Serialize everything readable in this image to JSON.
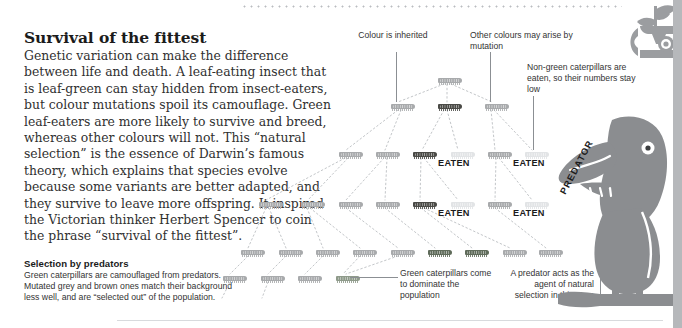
{
  "article": {
    "headline": "Survival of the fittest",
    "body": "Genetic variation can make the difference between life and death. A leaf-eating insect that is leaf-green can stay hidden from insect-eaters, but colour mutations spoil its camouflage. Green leaf-eaters are more likely to survive and breed, whereas other colours will not. This “natural selection” is the essence of Darwin’s famous theory, which explains that species evolve because some variants are better adapted, and they survive to leave more offspring. It inspired the Victorian thinker Herbert Spencer to coin the phrase “survival of the fittest”.",
    "sub_heading": "Selection by predators",
    "sub_body": "Green caterpillars are camouflaged from predators. Mutated grey and brown ones match their background less well, and are “selected out” of the population."
  },
  "annotations": {
    "colour_inherited": "Colour is inherited",
    "other_colours": "Other colours may arise by mutation",
    "non_green": "Non-green caterpillars are eaten, so their numbers stay low",
    "green_dominate": "Green caterpillars come to dominate the population",
    "predator_agent": "A predator acts as the agent of natural selection in this case",
    "eaten_1": "EATEN",
    "eaten_2": "EATEN",
    "eaten_3": "EATEN",
    "eaten_4": "EATEN",
    "predator_label": "PREDATOR"
  },
  "colors": {
    "green": "#8e9a8a",
    "dark_green": "#5f6b5a",
    "grey": "#a8aaac",
    "light_grey": "#cfd1d3",
    "pale": "#e2e4e6",
    "brown": "#4a4a46",
    "bird": "#8b8d90",
    "badge": "#9b9da0",
    "rule": "#d8dadd",
    "leader": "#8b8f93"
  },
  "chart_data": {
    "type": "diagram",
    "generations": [
      {
        "row": 1,
        "y": 78,
        "individuals": [
          {
            "x": 437,
            "colour": "grey"
          }
        ]
      },
      {
        "row": 2,
        "y": 104,
        "individuals": [
          {
            "x": 390,
            "colour": "grey"
          },
          {
            "x": 437,
            "colour": "brown"
          },
          {
            "x": 484,
            "colour": "grey"
          }
        ]
      },
      {
        "row": 3,
        "y": 152,
        "individuals": [
          {
            "x": 338,
            "colour": "grey"
          },
          {
            "x": 375,
            "colour": "grey"
          },
          {
            "x": 412,
            "colour": "brown"
          },
          {
            "x": 450,
            "colour": "pale"
          },
          {
            "x": 487,
            "colour": "grey"
          },
          {
            "x": 524,
            "colour": "pale"
          }
        ],
        "eaten_marks": [
          {
            "x": 444,
            "y": 163,
            "label": "EATEN"
          },
          {
            "x": 519,
            "y": 163,
            "label": "EATEN"
          }
        ]
      },
      {
        "row": 4,
        "y": 202,
        "individuals": [
          {
            "x": 258,
            "colour": "grey"
          },
          {
            "x": 300,
            "colour": "grey"
          },
          {
            "x": 338,
            "colour": "grey"
          },
          {
            "x": 375,
            "colour": "grey"
          },
          {
            "x": 412,
            "colour": "brown"
          },
          {
            "x": 450,
            "colour": "pale"
          },
          {
            "x": 487,
            "colour": "grey"
          },
          {
            "x": 524,
            "colour": "pale"
          }
        ],
        "eaten_marks": [
          {
            "x": 444,
            "y": 212,
            "label": "EATEN"
          },
          {
            "x": 519,
            "y": 212,
            "label": "EATEN"
          }
        ]
      },
      {
        "row": 5,
        "y": 250,
        "individuals": [
          {
            "x": 240,
            "colour": "grey"
          },
          {
            "x": 278,
            "colour": "grey"
          },
          {
            "x": 315,
            "colour": "grey"
          },
          {
            "x": 352,
            "colour": "grey"
          },
          {
            "x": 390,
            "colour": "grey"
          },
          {
            "x": 427,
            "colour": "dark_green"
          },
          {
            "x": 464,
            "colour": "dark_green"
          },
          {
            "x": 502,
            "colour": "grey"
          },
          {
            "x": 538,
            "colour": "grey"
          }
        ]
      },
      {
        "row": 6,
        "y": 276,
        "individuals": [
          {
            "x": 222,
            "colour": "grey"
          },
          {
            "x": 260,
            "colour": "grey"
          },
          {
            "x": 297,
            "colour": "grey"
          },
          {
            "x": 335,
            "colour": "green"
          }
        ]
      }
    ],
    "legend": [
      {
        "label": "green – camouflaged, survives",
        "colour": "#8e9a8a"
      },
      {
        "label": "grey / brown – mutated, eaten",
        "colour": "#a8aaac"
      }
    ]
  }
}
